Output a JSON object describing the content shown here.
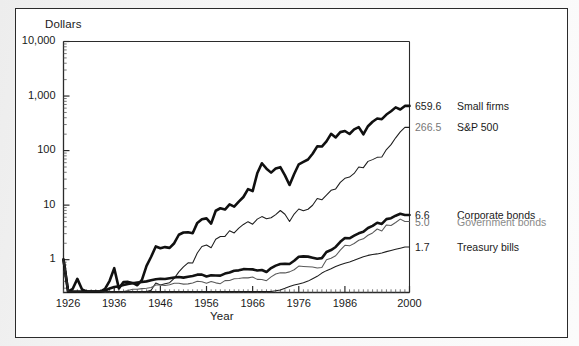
{
  "figure": {
    "background_color": "#ffffff",
    "frame_color": "#2b2b2b"
  },
  "axes": {
    "y_axis_title": "Dollars",
    "x_axis_title": "Year",
    "y_ticks": [
      "10,000",
      "1,000",
      "100",
      "10",
      "1"
    ],
    "x_ticks": [
      "1926",
      "1936",
      "1946",
      "1956",
      "1966",
      "1976",
      "1986",
      "2000"
    ],
    "y_scale": "log",
    "grid": "off"
  },
  "series_labels": [
    {
      "value": "659.6",
      "name": "Small firms",
      "value_style": "dark",
      "name_style": "dark"
    },
    {
      "value": "266.5",
      "name": "S&P 500",
      "value_style": "gray",
      "name_style": "dark"
    },
    {
      "value": "6.6",
      "name": "Corporate bonds",
      "value_style": "dark",
      "name_style": "dark"
    },
    {
      "value": "5.0",
      "name": "Government bonds",
      "value_style": "gray",
      "name_style": "gray"
    },
    {
      "value": "1.7",
      "name": "Treasury bills",
      "value_style": "dark",
      "name_style": "dark"
    }
  ],
  "chart_data": {
    "type": "line",
    "title": "",
    "xlabel": "Year",
    "ylabel": "Dollars",
    "yscale": "log",
    "ylim": [
      0.25,
      10000
    ],
    "xlim": [
      1925,
      2000
    ],
    "ytick_values": [
      1,
      10,
      100,
      1000,
      10000
    ],
    "ytick_labels": [
      "1",
      "10",
      "100",
      "1,000",
      "10,000"
    ],
    "xtick_values": [
      1926,
      1936,
      1946,
      1956,
      1966,
      1976,
      1986,
      2000
    ],
    "xtick_labels": [
      "1926",
      "1936",
      "1946",
      "1956",
      "1966",
      "1976",
      "1986",
      "2000"
    ],
    "legend_position": "right-inline",
    "grid": false,
    "x": [
      1925,
      1926,
      1927,
      1928,
      1929,
      1930,
      1931,
      1932,
      1933,
      1934,
      1935,
      1936,
      1937,
      1938,
      1939,
      1940,
      1941,
      1942,
      1943,
      1944,
      1945,
      1946,
      1947,
      1948,
      1949,
      1950,
      1951,
      1952,
      1953,
      1954,
      1955,
      1956,
      1957,
      1958,
      1959,
      1960,
      1961,
      1962,
      1963,
      1964,
      1965,
      1966,
      1967,
      1968,
      1969,
      1970,
      1971,
      1972,
      1973,
      1974,
      1975,
      1976,
      1977,
      1978,
      1979,
      1980,
      1981,
      1982,
      1983,
      1984,
      1985,
      1986,
      1987,
      1988,
      1989,
      1990,
      1991,
      1992,
      1993,
      1994,
      1995,
      1996,
      1997,
      1998,
      1999,
      2000
    ],
    "series": [
      {
        "name": "Small firms",
        "final_value": 659.6,
        "line_width": "thick",
        "color": "#101010",
        "values": [
          1.0,
          1.03,
          1.25,
          1.9,
          1.22,
          0.67,
          0.33,
          0.37,
          0.99,
          1.25,
          1.75,
          2.98,
          1.27,
          1.66,
          1.67,
          1.6,
          1.45,
          1.82,
          3.28,
          4.83,
          7.46,
          6.91,
          7.26,
          7.03,
          8.55,
          12.23,
          13.45,
          13.56,
          13.0,
          20.17,
          23.59,
          24.44,
          19.55,
          33.72,
          37.41,
          35.46,
          44.15,
          40.01,
          49.45,
          60.21,
          84.09,
          77.39,
          163.61,
          250.53,
          199.21,
          168.46,
          200.23,
          212.39,
          149.98,
          100.02,
          159.16,
          239.36,
          265.46,
          293.48,
          374.43,
          510.25,
          506.21,
          629.84,
          867.0,
          744.85,
          931.75,
          977.8,
          860.22,
          1046.01,
          1148.35,
          850.1,
          1195.14,
          1446.62,
          1655.42,
          1608.45,
          1955.8,
          2244.75,
          2648.0,
          2418.13,
          2818.4,
          659.6
        ]
      },
      {
        "name": "S&P 500",
        "final_value": 266.5,
        "line_width": "thin",
        "color": "#1d1d1d",
        "values": [
          1.0,
          1.12,
          1.53,
          2.2,
          2.02,
          1.52,
          0.86,
          0.79,
          1.22,
          1.2,
          1.78,
          2.38,
          1.55,
          2.03,
          2.02,
          1.82,
          1.61,
          1.94,
          2.44,
          2.92,
          3.98,
          3.66,
          3.87,
          4.04,
          4.83,
          6.36,
          7.89,
          9.33,
          9.24,
          14.11,
          18.56,
          19.78,
          17.64,
          25.3,
          28.32,
          28.46,
          36.11,
          32.95,
          40.47,
          47.14,
          53.01,
          47.67,
          59.1,
          65.64,
          60.06,
          62.47,
          71.41,
          84.96,
          72.5,
          53.31,
          73.14,
          90.58,
          84.08,
          89.59,
          106.11,
          140.52,
          133.62,
          162.39,
          199.02,
          211.54,
          278.58,
          330.68,
          348.06,
          405.88,
          534.45,
          517.87,
          675.59,
          727.41,
          800.78,
          811.33,
          1113.92,
          1369.15,
          1825.96,
          2348.04,
          2840.33,
          266.5
        ]
      },
      {
        "name": "Corporate bonds",
        "final_value": 6.6,
        "line_width": "thick",
        "color": "#121212",
        "values": [
          1.0,
          1.07,
          1.15,
          1.19,
          1.23,
          1.32,
          1.3,
          1.44,
          1.59,
          1.81,
          1.98,
          2.11,
          2.17,
          2.31,
          2.4,
          2.48,
          2.55,
          2.61,
          2.68,
          2.81,
          2.94,
          3.0,
          2.96,
          3.06,
          3.15,
          3.22,
          3.14,
          3.26,
          3.37,
          3.56,
          3.56,
          3.3,
          3.46,
          3.44,
          3.41,
          3.72,
          3.9,
          4.2,
          4.27,
          4.49,
          4.47,
          4.45,
          4.23,
          4.34,
          3.99,
          4.69,
          5.21,
          5.58,
          5.63,
          5.58,
          6.39,
          7.57,
          7.69,
          7.62,
          7.29,
          6.97,
          7.16,
          9.25,
          10.06,
          11.45,
          14.24,
          16.73,
          16.54,
          18.43,
          20.39,
          21.7,
          25.49,
          27.95,
          31.9,
          30.34,
          37.16,
          38.54,
          42.83,
          46.56,
          44.24,
          6.6
        ]
      },
      {
        "name": "Government bonds",
        "final_value": 5.0,
        "line_width": "thin",
        "color": "#5a5a5a",
        "values": [
          1.0,
          1.08,
          1.17,
          1.17,
          1.21,
          1.27,
          1.2,
          1.4,
          1.4,
          1.54,
          1.61,
          1.73,
          1.73,
          1.84,
          1.94,
          2.06,
          2.05,
          2.11,
          2.15,
          2.21,
          2.46,
          2.46,
          2.4,
          2.48,
          2.64,
          2.64,
          2.55,
          2.58,
          2.68,
          2.87,
          2.83,
          2.66,
          2.85,
          2.69,
          2.6,
          2.96,
          2.98,
          3.19,
          3.23,
          3.34,
          3.32,
          3.44,
          3.12,
          3.11,
          2.95,
          3.46,
          3.92,
          4.14,
          4.1,
          4.28,
          4.68,
          5.46,
          5.38,
          5.31,
          5.25,
          5.05,
          5.15,
          7.17,
          7.63,
          8.44,
          10.71,
          13.13,
          12.84,
          14.2,
          16.25,
          17.29,
          20.08,
          22.16,
          26.13,
          24.08,
          31.07,
          30.28,
          34.44,
          39.7,
          35.83,
          5.0
        ]
      },
      {
        "name": "Treasury bills",
        "final_value": 1.7,
        "line_width": "thin",
        "color": "#1d1d1d",
        "values": [
          1.0,
          1.03,
          1.06,
          1.1,
          1.15,
          1.19,
          1.2,
          1.21,
          1.21,
          1.21,
          1.21,
          1.22,
          1.22,
          1.22,
          1.22,
          1.22,
          1.22,
          1.23,
          1.24,
          1.24,
          1.25,
          1.26,
          1.26,
          1.27,
          1.29,
          1.31,
          1.33,
          1.36,
          1.39,
          1.4,
          1.43,
          1.47,
          1.52,
          1.54,
          1.59,
          1.63,
          1.67,
          1.72,
          1.78,
          1.85,
          1.92,
          2.01,
          2.1,
          2.21,
          2.35,
          2.5,
          2.61,
          2.71,
          2.9,
          3.13,
          3.32,
          3.49,
          3.67,
          3.93,
          4.34,
          4.81,
          5.52,
          6.11,
          6.64,
          7.3,
          7.86,
          8.35,
          8.81,
          9.44,
          10.23,
          11.02,
          11.64,
          12.05,
          12.4,
          12.93,
          13.64,
          14.34,
          15.07,
          15.79,
          16.52,
          1.7
        ]
      }
    ]
  }
}
